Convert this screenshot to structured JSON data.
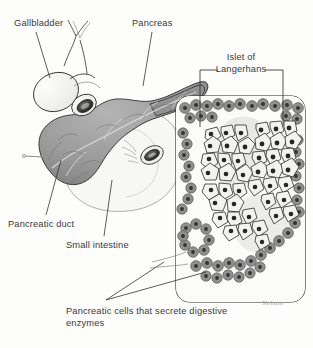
{
  "figure": {
    "background_color": "#fdfdfb",
    "text_color": "#3a3a3a"
  },
  "labels": {
    "gallbladder": "Gallbladder",
    "pancreas": "Pancreas",
    "islet": "Islet of Langerhans",
    "pancreatic_duct": "Pancreatic duct",
    "small_intestine": "Small intestine",
    "caption_line1": "Pancreatic cells that",
    "caption_line2": "secrete digestive enzymes",
    "caption": "Pancreatic cells that secrete digestive enzymes"
  },
  "credit": {
    "signature": "Nelson"
  },
  "colors": {
    "pancreas_fill": "#9a9a9a",
    "pancreas_shadow": "#7d7d7d",
    "pancreas_highlight": "#c2c2c2",
    "organ_pale": "#f4f4f2",
    "outline": "#2e2e2e",
    "acinar_fill": "#8f8f8f",
    "acinar_nucleus": "#3c3c3c",
    "islet_cell_fill": "#f2f2f0",
    "islet_nucleus": "#262626",
    "panel_border": "#222222",
    "leader_line": "#333333"
  },
  "panel": {
    "name": "histology-inset",
    "x": 176,
    "y": 96,
    "width": 129,
    "height": 206,
    "corner_radius": 14
  }
}
